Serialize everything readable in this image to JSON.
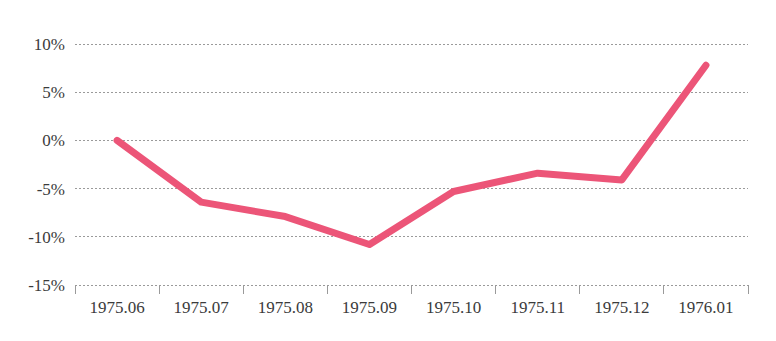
{
  "chart_data": {
    "type": "line",
    "title": "",
    "subtitle": "",
    "xlabel": "",
    "ylabel": "",
    "categories": [
      "1975.06",
      "1975.07",
      "1975.08",
      "1975.09",
      "1975.10",
      "1975.11",
      "1975.12",
      "1976.01"
    ],
    "series": [
      {
        "name": "",
        "color": "#ec5578",
        "values": [
          0.0,
          -6.4,
          -7.9,
          -10.8,
          -5.3,
          -3.4,
          -4.1,
          7.8
        ]
      }
    ],
    "ylim": [
      -15,
      10
    ],
    "y_ticks": [
      10,
      5,
      0,
      -5,
      -10,
      -15
    ],
    "y_tick_labels": [
      "10%",
      "5%",
      "0%",
      "-5%",
      "-10%",
      "-15%"
    ],
    "x_tick_labels": [
      "1975.06",
      "1975.07",
      "1975.08",
      "1975.09",
      "1975.10",
      "1975.11",
      "1976.01"
    ],
    "grid": true,
    "grid_style": "dashed-horizontal",
    "legend": false,
    "legend_position": "none",
    "axis_color": "#9a9a9a",
    "text_color": "#3b3b3b",
    "background": "#ffffff",
    "data_labels_shown": false,
    "markers": false
  }
}
